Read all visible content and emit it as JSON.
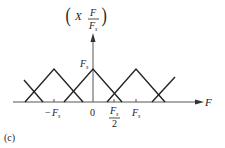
{
  "figure": {
    "panel_label": "(c)",
    "y_axis_label": {
      "func": "X",
      "num": "F",
      "den": "F",
      "den_sub": "s"
    },
    "x_axis_label": "F",
    "peak_label": {
      "main": "F",
      "sub": "s"
    },
    "ticks": [
      {
        "id": "neg_fs",
        "sign": "−",
        "main": "F",
        "sub": "s"
      },
      {
        "id": "zero",
        "text": "0"
      },
      {
        "id": "half_fs",
        "num": "F",
        "num_sub": "s",
        "den": "2"
      },
      {
        "id": "fs",
        "main": "F",
        "sub": "s"
      }
    ],
    "colors": {
      "line": "#222222",
      "axis": "#555555",
      "background": "#ffffff"
    }
  }
}
